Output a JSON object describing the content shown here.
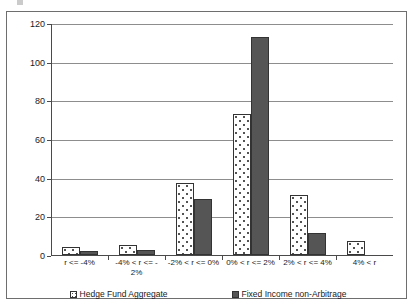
{
  "chart_data": {
    "type": "bar",
    "title": "",
    "subtitle": "",
    "xlabel": "",
    "ylabel": "",
    "ylim": [
      0,
      120
    ],
    "ytick_labels": [
      "0",
      "20",
      "40",
      "60",
      "80",
      "100",
      "120"
    ],
    "ytick_values": [
      0,
      20,
      40,
      60,
      80,
      100,
      120
    ],
    "grid": true,
    "legend_position": "bottom",
    "categories": [
      "r <= -4%",
      "-4% < r <= -2%",
      "-2% < r <= 0%",
      "0% < r <= 2%",
      "2% < r <= 4%",
      "4% < r"
    ],
    "category_label_lines": [
      [
        "r <= -4%"
      ],
      [
        "-4% < r <= -",
        "2%"
      ],
      [
        "-2% < r <= 0%"
      ],
      [
        "0% < r <= 2%"
      ],
      [
        "2% < r <= 4%"
      ],
      [
        "4% < r"
      ]
    ],
    "series": [
      {
        "name": "Hedge Fund Aggregate",
        "values": [
          4,
          5,
          37,
          73,
          31,
          7
        ],
        "color": "#ffffff",
        "pattern": "dotted"
      },
      {
        "name": "Fixed Income non-Arbitrage",
        "values": [
          2,
          2.5,
          29,
          113,
          11.5,
          0
        ],
        "color": "#555555",
        "pattern": "solid"
      }
    ]
  },
  "legend": {
    "entries": [
      {
        "label": "Hedge Fund Aggregate",
        "swatch": "legend-swatch-hedge-fund-aggregate"
      },
      {
        "label": "Fixed Income non-Arbitrage",
        "swatch": "legend-swatch-fixed-income-non-arbitrage"
      }
    ]
  },
  "colors": {
    "series_light": "#ffffff",
    "series_dark": "#555555",
    "gridline": "#8d8d8d",
    "axis": "#4a4a4a",
    "frame": "#6e6e6e",
    "text": "#1a1a1a"
  }
}
